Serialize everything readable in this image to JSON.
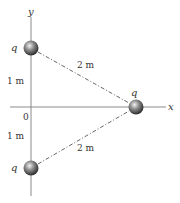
{
  "diagram": {
    "axes": {
      "x_label": "x",
      "y_label": "y",
      "origin_label": "0"
    },
    "charges": [
      {
        "id": "top",
        "label": "q"
      },
      {
        "id": "right",
        "label": "q"
      },
      {
        "id": "bottom",
        "label": "q"
      }
    ],
    "distances": {
      "top_to_origin": "1 m",
      "bottom_to_origin": "1 m",
      "top_to_right": "2 m",
      "bottom_to_right": "2 m"
    },
    "colors": {
      "axis": "#8a8a8a",
      "dash": "#555555",
      "sphere_light": "#e0e0e0",
      "sphere_dark": "#3a3a3a"
    }
  }
}
